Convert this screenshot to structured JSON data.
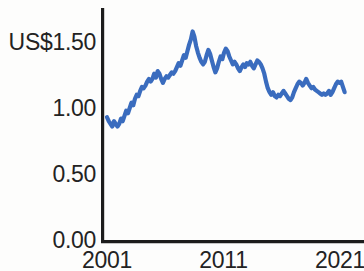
{
  "chart_data": {
    "type": "line",
    "title": "",
    "subtitle": "",
    "xlabel": "",
    "ylabel": "US$",
    "xlim": [
      2001,
      2021.4
    ],
    "ylim": [
      0.0,
      1.78
    ],
    "grid": false,
    "legend": "none",
    "y_ticks": [
      {
        "value": 0.0,
        "label": "0.00"
      },
      {
        "value": 0.5,
        "label": "0.50"
      },
      {
        "value": 1.0,
        "label": "1.00"
      },
      {
        "value": 1.5,
        "label": "US$1.50"
      }
    ],
    "x_ticks": [
      {
        "value": 2001,
        "label": "2001"
      },
      {
        "value": 2011,
        "label": "2011"
      },
      {
        "value": 2021,
        "label": "2021"
      }
    ],
    "series": [
      {
        "name": "Exchange rate (US$)",
        "color": "#3a6cbe",
        "x": [
          2001.0,
          2001.15,
          2001.3,
          2001.45,
          2001.6,
          2001.75,
          2001.9,
          2002.05,
          2002.2,
          2002.35,
          2002.5,
          2002.65,
          2002.8,
          2002.95,
          2003.1,
          2003.25,
          2003.4,
          2003.55,
          2003.7,
          2003.85,
          2004.0,
          2004.15,
          2004.3,
          2004.45,
          2004.6,
          2004.75,
          2004.9,
          2005.05,
          2005.2,
          2005.35,
          2005.5,
          2005.65,
          2005.8,
          2005.95,
          2006.1,
          2006.25,
          2006.4,
          2006.55,
          2006.7,
          2006.85,
          2007.0,
          2007.15,
          2007.3,
          2007.45,
          2007.6,
          2007.75,
          2007.9,
          2008.05,
          2008.2,
          2008.35,
          2008.5,
          2008.65,
          2008.8,
          2008.95,
          2009.1,
          2009.25,
          2009.4,
          2009.55,
          2009.7,
          2009.85,
          2010.0,
          2010.15,
          2010.3,
          2010.45,
          2010.6,
          2010.75,
          2010.9,
          2011.05,
          2011.2,
          2011.35,
          2011.5,
          2011.65,
          2011.8,
          2011.95,
          2012.1,
          2012.25,
          2012.4,
          2012.55,
          2012.7,
          2012.85,
          2013.0,
          2013.15,
          2013.3,
          2013.45,
          2013.6,
          2013.75,
          2013.9,
          2014.05,
          2014.2,
          2014.35,
          2014.5,
          2014.65,
          2014.8,
          2014.95,
          2015.1,
          2015.25,
          2015.4,
          2015.55,
          2015.7,
          2015.85,
          2016.0,
          2016.15,
          2016.3,
          2016.45,
          2016.6,
          2016.75,
          2016.9,
          2017.05,
          2017.2,
          2017.35,
          2017.5,
          2017.65,
          2017.8,
          2017.95,
          2018.1,
          2018.25,
          2018.4,
          2018.55,
          2018.7,
          2018.85,
          2019.0,
          2019.15,
          2019.3,
          2019.45,
          2019.6,
          2019.75,
          2019.9,
          2020.05,
          2020.2,
          2020.35,
          2020.5,
          2020.65,
          2020.8,
          2020.95,
          2021.1,
          2021.25,
          2021.4
        ],
        "values": [
          0.93,
          0.9,
          0.88,
          0.86,
          0.9,
          0.88,
          0.86,
          0.88,
          0.92,
          0.9,
          0.94,
          0.98,
          0.96,
          1.0,
          1.04,
          1.02,
          1.07,
          1.1,
          1.09,
          1.13,
          1.16,
          1.15,
          1.17,
          1.2,
          1.22,
          1.2,
          1.22,
          1.26,
          1.23,
          1.28,
          1.26,
          1.22,
          1.19,
          1.22,
          1.24,
          1.23,
          1.25,
          1.27,
          1.26,
          1.28,
          1.31,
          1.34,
          1.32,
          1.36,
          1.4,
          1.38,
          1.43,
          1.48,
          1.52,
          1.58,
          1.54,
          1.47,
          1.42,
          1.38,
          1.35,
          1.33,
          1.35,
          1.4,
          1.44,
          1.41,
          1.36,
          1.31,
          1.27,
          1.3,
          1.35,
          1.39,
          1.37,
          1.42,
          1.45,
          1.43,
          1.39,
          1.36,
          1.33,
          1.35,
          1.33,
          1.3,
          1.28,
          1.31,
          1.33,
          1.31,
          1.34,
          1.33,
          1.35,
          1.32,
          1.3,
          1.33,
          1.36,
          1.35,
          1.33,
          1.3,
          1.26,
          1.2,
          1.15,
          1.12,
          1.1,
          1.12,
          1.09,
          1.08,
          1.1,
          1.09,
          1.11,
          1.13,
          1.11,
          1.09,
          1.07,
          1.06,
          1.08,
          1.12,
          1.15,
          1.18,
          1.2,
          1.19,
          1.17,
          1.19,
          1.22,
          1.19,
          1.17,
          1.15,
          1.16,
          1.14,
          1.13,
          1.12,
          1.11,
          1.1,
          1.11,
          1.1,
          1.11,
          1.13,
          1.1,
          1.12,
          1.15,
          1.18,
          1.2,
          1.19,
          1.2,
          1.16,
          1.12
        ]
      }
    ]
  },
  "axis": {
    "line_color": "#1c1c1c"
  }
}
